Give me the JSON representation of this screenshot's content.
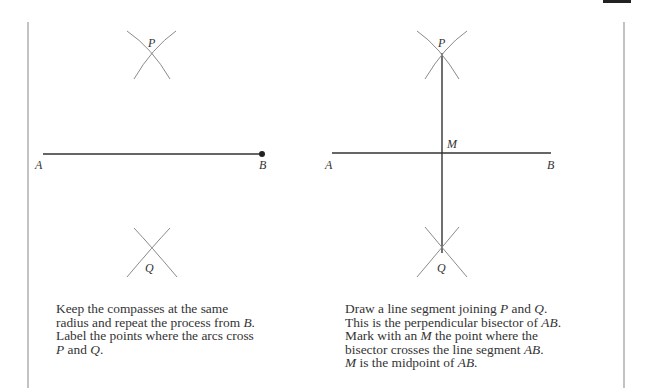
{
  "panels": [
    {
      "id": "left",
      "labels": {
        "A": "A",
        "B": "B",
        "P": "P",
        "Q": "Q"
      },
      "caption": [
        {
          "t": "Keep the compasses at the same"
        },
        {
          "t": "radius and repeat the process from ",
          "i": "B",
          "t2": "."
        },
        {
          "t": "Label the points where the arcs cross"
        },
        {
          "i": "P",
          "t2": " and ",
          "i2": "Q",
          "t3": "."
        }
      ],
      "caption_text": "Keep the compasses at the same radius and repeat the process from B. Label the points where the arcs cross P and Q."
    },
    {
      "id": "right",
      "labels": {
        "A": "A",
        "B": "B",
        "P": "P",
        "Q": "Q",
        "M": "M"
      },
      "caption_text": "Draw a line segment joining P and Q. This is the perpendicular bisector of AB. Mark with an M the point where the bisector crosses the line segment AB. M is the midpoint of AB."
    }
  ],
  "left_caption": {
    "l1": "Keep the compasses at the same",
    "l2a": "radius and repeat the process from ",
    "l2b": "B",
    "l2c": ".",
    "l3": "Label the points where the arcs cross",
    "l4a": "P",
    "l4b": " and ",
    "l4c": "Q",
    "l4d": "."
  },
  "right_caption": {
    "l1a": "Draw a line segment joining ",
    "l1b": "P",
    "l1c": " and ",
    "l1d": "Q",
    "l1e": ".",
    "l2a": "This is the perpendicular bisector of ",
    "l2b": "AB",
    "l2c": ".",
    "l3a": "Mark with an ",
    "l3b": "M",
    "l3c": " the point where the",
    "l4a": "bisector crosses the line segment ",
    "l4b": "AB",
    "l4c": ".",
    "l5a": "M",
    "l5b": " is the midpoint of ",
    "l5c": "AB",
    "l5d": "."
  },
  "labels": {
    "A": "A",
    "B": "B",
    "P": "P",
    "Q": "Q",
    "M": "M"
  },
  "colors": {
    "line": "#333333",
    "arc": "#8a8a8a",
    "border": "#9a9a9a"
  }
}
